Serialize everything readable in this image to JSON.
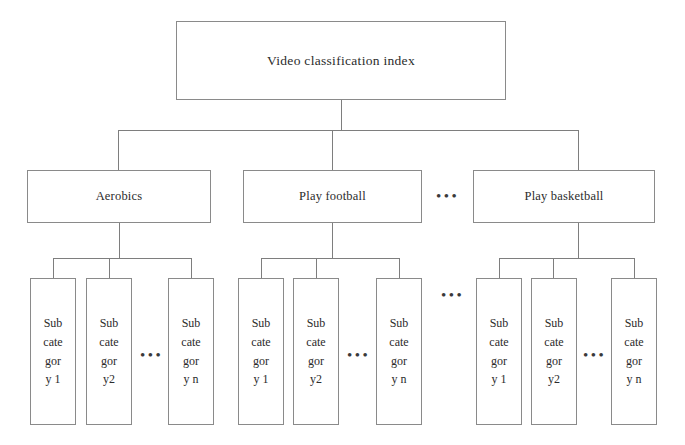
{
  "diagram": {
    "title": "Video classification index",
    "type": "tree-hierarchy",
    "root": {
      "label": "Video classification index"
    },
    "level2": [
      {
        "label": "Aerobics"
      },
      {
        "label": "Play football"
      },
      {
        "label": "Play basketball"
      }
    ],
    "level2_ellipsis": "•••",
    "leaf_groups": [
      {
        "parent": "Aerobics",
        "leaves": [
          {
            "lines": [
              "Sub",
              "cate",
              "gor",
              "y 1"
            ]
          },
          {
            "lines": [
              "Sub",
              "cate",
              "gor",
              "y2"
            ]
          },
          {
            "lines": [
              "Sub",
              "cate",
              "gor",
              "y n"
            ]
          }
        ],
        "inner_ellipsis": "•••"
      },
      {
        "parent": "Play football",
        "leaves": [
          {
            "lines": [
              "Sub",
              "cate",
              "gor",
              "y 1"
            ]
          },
          {
            "lines": [
              "Sub",
              "cate",
              "gor",
              "y2"
            ]
          },
          {
            "lines": [
              "Sub",
              "cate",
              "gor",
              "y n"
            ]
          }
        ],
        "inner_ellipsis": "•••"
      },
      {
        "parent": "Play basketball",
        "leaves": [
          {
            "lines": [
              "Sub",
              "cate",
              "gor",
              "y 1"
            ]
          },
          {
            "lines": [
              "Sub",
              "cate",
              "gor",
              "y2"
            ]
          },
          {
            "lines": [
              "Sub",
              "cate",
              "gor",
              "y n"
            ]
          }
        ],
        "inner_ellipsis": "•••"
      }
    ],
    "leaf_row_ellipsis": "•••",
    "colors": {
      "background": "#ffffff",
      "box_border": "#8a8a8a",
      "connector": "#7e7e7e",
      "text": "#2b2b2b"
    }
  }
}
